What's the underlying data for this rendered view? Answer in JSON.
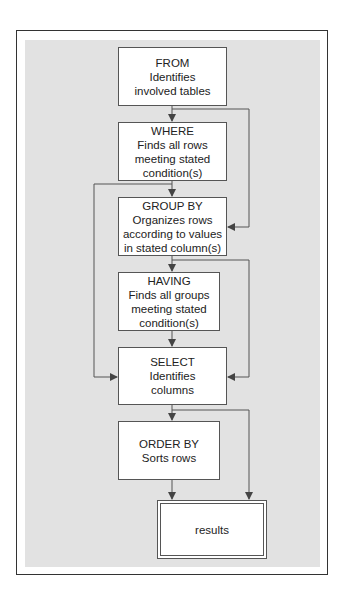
{
  "diagram": {
    "type": "flowchart",
    "colors": {
      "panel": "#e2e2e2",
      "box": "#ffffff",
      "line": "#555555",
      "frame": "#333333"
    },
    "nodes": [
      {
        "id": "from",
        "title": "FROM",
        "lines": [
          "Identifies",
          "involved tables"
        ]
      },
      {
        "id": "where",
        "title": "WHERE",
        "lines": [
          "Finds all rows",
          "meeting stated",
          "condition(s)"
        ]
      },
      {
        "id": "group_by",
        "title": "GROUP BY",
        "lines": [
          "Organizes rows",
          "according to values",
          "in stated column(s)"
        ]
      },
      {
        "id": "having",
        "title": "HAVING",
        "lines": [
          "Finds all groups",
          "meeting stated",
          "condition(s)"
        ]
      },
      {
        "id": "select",
        "title": "SELECT",
        "lines": [
          "Identifies",
          "columns"
        ]
      },
      {
        "id": "order_by",
        "title": "ORDER BY",
        "lines": [
          "Sorts rows"
        ]
      },
      {
        "id": "results",
        "title": "results",
        "lines": []
      }
    ],
    "edges": [
      {
        "from": "from",
        "to": "where"
      },
      {
        "from": "from",
        "to": "group_by",
        "route": "right-bypass"
      },
      {
        "from": "where",
        "to": "group_by"
      },
      {
        "from": "where",
        "to": "select",
        "route": "left-bypass"
      },
      {
        "from": "group_by",
        "to": "having"
      },
      {
        "from": "group_by",
        "to": "select",
        "route": "right-bypass"
      },
      {
        "from": "having",
        "to": "select"
      },
      {
        "from": "select",
        "to": "order_by"
      },
      {
        "from": "select",
        "to": "results",
        "route": "right-bypass"
      },
      {
        "from": "order_by",
        "to": "results"
      }
    ]
  }
}
